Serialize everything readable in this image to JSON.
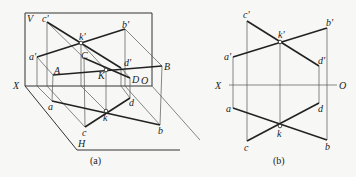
{
  "figure_a": {
    "caption": "(a)",
    "labels": {
      "V": "V",
      "H": "H",
      "X": "X",
      "O": "O",
      "c_prime": "c'",
      "b_prime": "b'",
      "k_prime": "k'",
      "a_prime": "a'",
      "d_prime": "d'",
      "C": "C",
      "K": "K",
      "D": "D",
      "A": "A",
      "B": "B",
      "a": "a",
      "d": "d",
      "k": "k",
      "c": "c",
      "b": "b"
    }
  },
  "figure_b": {
    "caption": "(b)",
    "labels": {
      "X": "X",
      "O": "O",
      "c_prime": "c'",
      "b_prime": "b'",
      "k_prime": "k'",
      "a_prime": "a'",
      "d_prime": "d'",
      "a": "a",
      "d": "d",
      "k": "k",
      "c": "c",
      "b": "b"
    }
  }
}
